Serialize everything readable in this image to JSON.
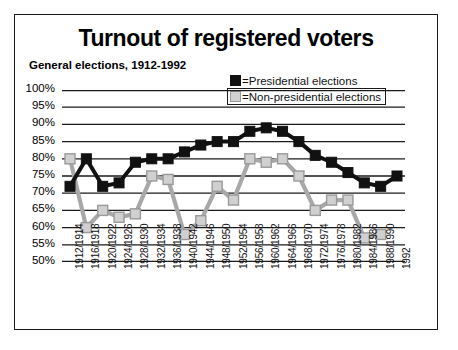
{
  "title": "Turnout of registered voters",
  "subtitle": "General elections, 1912-1992",
  "legend": {
    "presidential": "=Presidential elections",
    "non_presidential": "=Non-presidential elections"
  },
  "colors": {
    "presidential": "#111111",
    "non_presidential": "#d0d0d0",
    "non_presidential_edge": "#9a9a9a",
    "line_gray": "#a8a8a8",
    "axis": "#1a1a1a",
    "frame": "#1a1a1a"
  },
  "chart_data": {
    "type": "line",
    "title": "Turnout of registered voters",
    "subtitle": "General elections, 1912-1992",
    "xlabel": "",
    "ylabel": "",
    "ylim": [
      50,
      100
    ],
    "ytick_step": 5,
    "ytick_labels": [
      "100%",
      "95%",
      "90%",
      "85%",
      "80%",
      "75%",
      "70%",
      "65%",
      "60%",
      "55%",
      "50%"
    ],
    "grid": true,
    "legend_position": "top-right",
    "categories": [
      "1912/1914",
      "1916/1918",
      "1920/1922",
      "1924/1926",
      "1928/1930",
      "1932/1934",
      "1936/1938",
      "1940/1942",
      "1944/1946",
      "1948/1950",
      "1952/1954",
      "1956/1958",
      "1960/1962",
      "1964/1966",
      "1968/1970",
      "1972/1974",
      "1976/1978",
      "1980/1982",
      "1984/1986",
      "1988/1990",
      "1992"
    ],
    "series": [
      {
        "name": "Presidential elections",
        "marker": "square-filled",
        "color": "#111111",
        "values": [
          72,
          80,
          72,
          73,
          79,
          80,
          80,
          82,
          84,
          85,
          85,
          88,
          89,
          88,
          85,
          81,
          79,
          76,
          73,
          72,
          75
        ]
      },
      {
        "name": "Non-presidential elections",
        "marker": "square-open",
        "color": "#d0d0d0",
        "values": [
          80,
          60,
          65,
          63,
          64,
          75,
          74,
          58,
          62,
          72,
          68,
          80,
          79,
          80,
          75,
          65,
          68,
          68,
          57,
          58,
          null
        ]
      }
    ]
  }
}
